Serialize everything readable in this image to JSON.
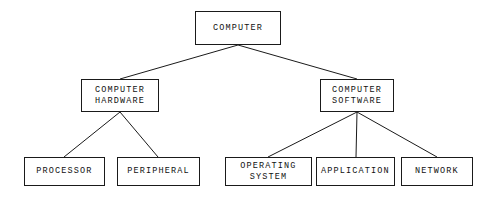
{
  "diagram": {
    "type": "hierarchy-tree",
    "background_color": "#ffffff",
    "line_color": "#1a1a1a",
    "text_color": "#111111",
    "nodes": [
      {
        "id": "computer",
        "label": "COMPUTER",
        "lines": [
          "COMPUTER"
        ],
        "level": 0,
        "x": 195,
        "y": 11,
        "width": 86,
        "height": 34
      },
      {
        "id": "computer-hardware",
        "label": "COMPUTER HARDWARE",
        "lines": [
          "COMPUTER",
          "HARDWARE"
        ],
        "level": 1,
        "x": 81,
        "y": 79,
        "width": 78,
        "height": 33
      },
      {
        "id": "computer-software",
        "label": "COMPUTER SOFTWARE",
        "lines": [
          "COMPUTER",
          "SOFTWARE"
        ],
        "level": 1,
        "x": 320,
        "y": 79,
        "width": 74,
        "height": 33
      },
      {
        "id": "processor",
        "label": "PROCESSOR",
        "lines": [
          "PROCESSOR"
        ],
        "level": 2,
        "x": 24,
        "y": 157,
        "width": 81,
        "height": 29
      },
      {
        "id": "peripheral",
        "label": "PERIPHERAL",
        "lines": [
          "PERIPHERAL"
        ],
        "level": 2,
        "x": 117,
        "y": 157,
        "width": 83,
        "height": 29
      },
      {
        "id": "operating-system",
        "label": "OPERATING SYSTEM",
        "lines": [
          "OPERATING",
          "SYSTEM"
        ],
        "level": 2,
        "x": 225,
        "y": 157,
        "width": 87,
        "height": 29
      },
      {
        "id": "application",
        "label": "APPLICATION",
        "lines": [
          "APPLICATION"
        ],
        "level": 2,
        "x": 316,
        "y": 157,
        "width": 79,
        "height": 29
      },
      {
        "id": "network",
        "label": "NETWORK",
        "lines": [
          "NETWORK"
        ],
        "level": 2,
        "x": 401,
        "y": 157,
        "width": 72,
        "height": 29
      }
    ],
    "edges": [
      {
        "id": "computer-to-hardware",
        "from": "computer",
        "to": "computer-hardware",
        "x1": 238,
        "y1": 45,
        "x2": 120,
        "y2": 79
      },
      {
        "id": "computer-to-software",
        "from": "computer",
        "to": "computer-software",
        "x1": 238,
        "y1": 45,
        "x2": 357,
        "y2": 79
      },
      {
        "id": "hardware-to-processor",
        "from": "computer-hardware",
        "to": "processor",
        "x1": 120,
        "y1": 112,
        "x2": 64,
        "y2": 157
      },
      {
        "id": "hardware-to-peripheral",
        "from": "computer-hardware",
        "to": "peripheral",
        "x1": 120,
        "y1": 112,
        "x2": 158,
        "y2": 157
      },
      {
        "id": "software-to-operating-system",
        "from": "computer-software",
        "to": "operating-system",
        "x1": 357,
        "y1": 112,
        "x2": 268,
        "y2": 157
      },
      {
        "id": "software-to-application",
        "from": "computer-software",
        "to": "application",
        "x1": 357,
        "y1": 112,
        "x2": 356,
        "y2": 157
      },
      {
        "id": "software-to-network",
        "from": "computer-software",
        "to": "network",
        "x1": 357,
        "y1": 112,
        "x2": 437,
        "y2": 157
      }
    ]
  }
}
